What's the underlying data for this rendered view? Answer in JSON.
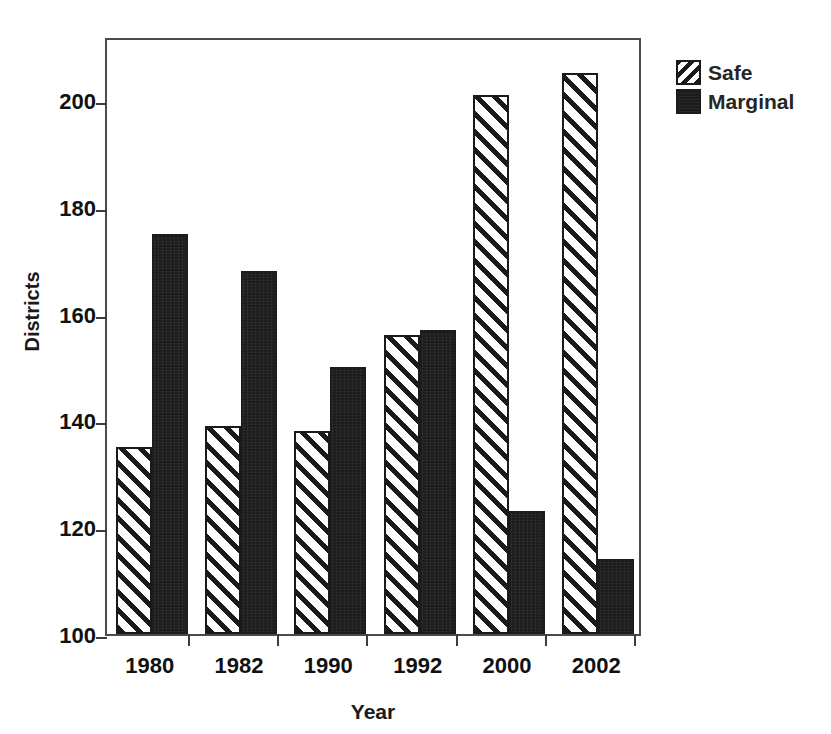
{
  "chart_data": {
    "type": "bar",
    "title": "",
    "subtitle": "",
    "xlabel": "Year",
    "ylabel": "Districts",
    "categories": [
      "1980",
      "1982",
      "1990",
      "1992",
      "2000",
      "2002"
    ],
    "series": [
      {
        "name": "Safe",
        "values": [
          135,
          139,
          138,
          156,
          201,
          205
        ],
        "fill": "diagonal-hatch",
        "color": "#1a1a1a"
      },
      {
        "name": "Marginal",
        "values": [
          175,
          168,
          150,
          157,
          123,
          114
        ],
        "fill": "solid",
        "color": "#1c1c1c"
      }
    ],
    "ylim": [
      100,
      212
    ],
    "yticks": [
      100,
      120,
      140,
      160,
      180,
      200
    ],
    "ytick_labels": [
      "100",
      "120",
      "140",
      "160",
      "180",
      "200"
    ],
    "xtick_labels": [
      "1980",
      "1982",
      "1990",
      "1992",
      "2000",
      "2002"
    ],
    "grid": false,
    "legend": {
      "position": "top-right-outside",
      "entries": [
        {
          "label": "Safe",
          "swatch": "diagonal-hatch"
        },
        {
          "label": "Marginal",
          "swatch": "solid-black"
        }
      ]
    },
    "axis_color": "#4a4a4a",
    "background": "#ffffff"
  },
  "legend": {
    "items": [
      {
        "label": "Safe"
      },
      {
        "label": "Marginal"
      }
    ]
  },
  "axes": {
    "y_title": "Districts",
    "x_title": "Year"
  }
}
